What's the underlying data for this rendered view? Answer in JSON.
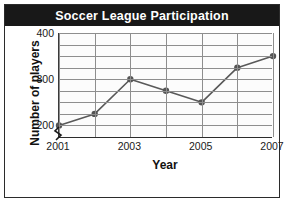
{
  "figure": {
    "title": "Soccer League Participation",
    "frame_color": "#2b2b2b",
    "banner_color": "#181818",
    "banner_text_color": "#ffffff"
  },
  "axis_break": {
    "name": "y-axis-break",
    "present": true
  },
  "chart_data": {
    "type": "line",
    "title": "Soccer League Participation",
    "xlabel": "Year",
    "ylabel": "Number of players",
    "x": [
      2001,
      2002,
      2003,
      2004,
      2005,
      2006,
      2007
    ],
    "values": [
      200,
      225,
      300,
      275,
      250,
      325,
      350
    ],
    "xtick_labels": [
      "2001",
      "2003",
      "2005",
      "2007"
    ],
    "xtick_values": [
      2001,
      2003,
      2005,
      2007
    ],
    "ytick_labels": [
      "200",
      "300",
      "400"
    ],
    "ytick_values": [
      200,
      300,
      400
    ],
    "ylim": [
      175,
      400
    ],
    "xlim": [
      2001,
      2007
    ],
    "grid": true,
    "grid_y_step": 25,
    "grid_color": "#8e8e8e",
    "line_color": "#595959",
    "marker_color": "#555555",
    "marker_shape": "circle",
    "legend": null,
    "y_axis_broken": true
  }
}
